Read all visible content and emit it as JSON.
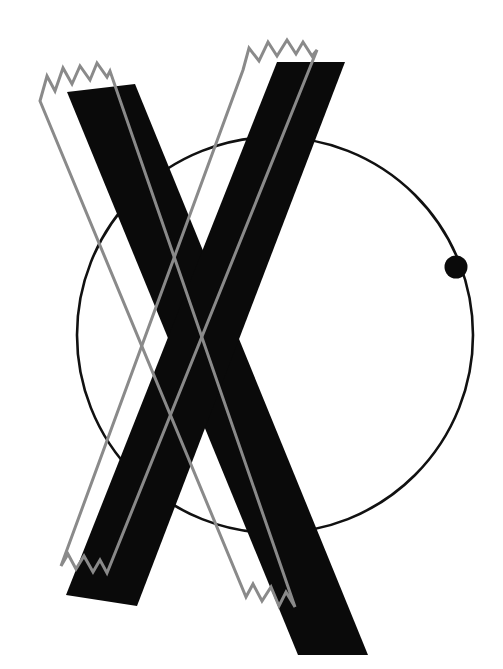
{
  "artwork": {
    "title": "Abstract Geometric Composition",
    "canvas": {
      "width": 503,
      "height": 669,
      "background": "#ffffff"
    },
    "description": "Bold black X formed by two thick diagonal bars, overlaid by a gray outlined X with torn jagged ends, and a thin black circle bearing a solid dot on its right edge."
  },
  "colors": {
    "background": "#ffffff",
    "black": "#0a0a0a",
    "gray": "#8a8a8a",
    "circle_stroke": "#111111",
    "dot_fill": "#0a0a0a"
  },
  "elements": {
    "circle": {
      "name": "thin-outline-circle",
      "center_x": 275,
      "center_y": 335,
      "radius": 198,
      "stroke_width": 2.6,
      "fill": "none"
    },
    "dot": {
      "name": "solid-dot-on-circle",
      "center_x": 456,
      "center_y": 267,
      "radius": 11.5,
      "angle_degrees": 20
    },
    "black_x": {
      "name": "bold-black-x",
      "stroke_a_label": "bold-bar-top-left-to-bottom-right",
      "stroke_b_label": "bold-bar-top-right-to-bottom-left",
      "stroke_a_points": "67,92 135,84 368,655 298,655",
      "stroke_b_points": "277,62 345,62 137,606 66,595"
    },
    "gray_x": {
      "name": "gray-outlined-torn-x",
      "stroke_width": 3.0,
      "stroke_a_label": "gray-outline-top-left-to-bottom-right",
      "stroke_b_label": "gray-outline-top-right-to-bottom-left",
      "torn_edges": [
        "top-left",
        "top-right",
        "bottom-left",
        "bottom-right"
      ]
    }
  },
  "geometry": {
    "gray_left_band": {
      "top_jagged": "40,101 47,76 55,91 63,68 72,84 80,66 90,80 97,63 107,77 110,71",
      "right_down": "110,71 295,607",
      "bottom_jagged": "295,607 286,592 279,606 271,587 262,601 253,584 246,597",
      "left_up": "246,597 40,101"
    },
    "gray_right_band": {
      "top_jagged": "243,70 249,48 259,61 268,42 277,56 287,40 296,54 303,42 312,56 317,50",
      "down_left": "317,50 107,573",
      "bottom_jagged": "107,573 100,560 93,572 84,556 76,569 68,554 61,566",
      "up_right": "61,566 243,70"
    }
  }
}
